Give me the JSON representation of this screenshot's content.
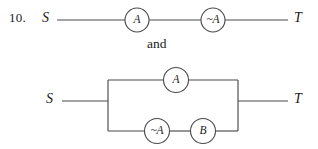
{
  "problem": {
    "number": "10.",
    "conjunction": "and"
  },
  "circuits": [
    {
      "id": "series-circuit",
      "type": "series",
      "source_label": "S",
      "target_label": "T",
      "switches": [
        {
          "name": "switch-a",
          "label": "A",
          "cx": 137,
          "cy": 20,
          "r": 12
        },
        {
          "name": "switch-not-a",
          "label": "~A",
          "cx": 213,
          "cy": 20,
          "r": 12
        }
      ],
      "wires": [
        {
          "name": "wire-source-to-a",
          "x1": 57,
          "y1": 20,
          "x2": 125,
          "y2": 20
        },
        {
          "name": "wire-a-to-not-a",
          "x1": 149,
          "y1": 20,
          "x2": 201,
          "y2": 20
        },
        {
          "name": "wire-not-a-to-target",
          "x1": 225,
          "y1": 20,
          "x2": 288,
          "y2": 20
        }
      ]
    },
    {
      "id": "parallel-circuit",
      "type": "parallel",
      "source_label": "S",
      "target_label": "T",
      "switches": [
        {
          "name": "switch-a",
          "label": "A",
          "cx": 176,
          "cy": 80,
          "r": 12.5
        },
        {
          "name": "switch-not-a",
          "label": "~A",
          "cx": 157,
          "cy": 131,
          "r": 12.5
        },
        {
          "name": "switch-b",
          "label": "B",
          "cx": 203,
          "cy": 131,
          "r": 12.5
        }
      ],
      "wires": [
        {
          "name": "wire-source-lead",
          "x1": 62,
          "y1": 101,
          "x2": 108,
          "y2": 101
        },
        {
          "name": "wire-left-bus",
          "x1": 108,
          "y1": 80,
          "x2": 108,
          "y2": 131
        },
        {
          "name": "wire-right-bus",
          "x1": 238,
          "y1": 80,
          "x2": 238,
          "y2": 131
        },
        {
          "name": "wire-target-lead",
          "x1": 238,
          "y1": 101,
          "x2": 288,
          "y2": 101
        },
        {
          "name": "wire-top-branch-left",
          "x1": 108,
          "y1": 80,
          "x2": 163.5,
          "y2": 80
        },
        {
          "name": "wire-top-branch-right",
          "x1": 188.5,
          "y1": 80,
          "x2": 238,
          "y2": 80
        },
        {
          "name": "wire-bottom-branch-left",
          "x1": 108,
          "y1": 131,
          "x2": 144.5,
          "y2": 131
        },
        {
          "name": "wire-bottom-branch-middle",
          "x1": 169.5,
          "y1": 131,
          "x2": 190.5,
          "y2": 131
        },
        {
          "name": "wire-bottom-branch-right",
          "x1": 215.5,
          "y1": 131,
          "x2": 238,
          "y2": 131
        }
      ]
    }
  ]
}
